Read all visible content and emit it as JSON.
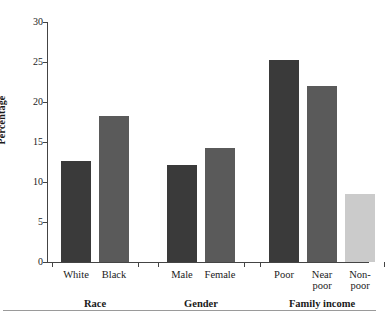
{
  "chart_data": {
    "type": "bar",
    "title": "",
    "xlabel": "",
    "ylabel": "Percentage",
    "ylim": [
      0,
      30
    ],
    "yticks": [
      0,
      5,
      10,
      15,
      20,
      25,
      30
    ],
    "grid": false,
    "legend": null,
    "groups": [
      {
        "name": "Race",
        "categories": [
          "White",
          "Black"
        ],
        "values": [
          12.6,
          18.2
        ],
        "colors": [
          "#3a3a3a",
          "#5a5a5a"
        ]
      },
      {
        "name": "Gender",
        "categories": [
          "Male",
          "Female"
        ],
        "values": [
          12.1,
          14.3
        ],
        "colors": [
          "#3a3a3a",
          "#5a5a5a"
        ]
      },
      {
        "name": "Family income",
        "categories": [
          "Poor",
          "Near poor",
          "Non-poor"
        ],
        "values": [
          25.3,
          22.0,
          8.5
        ],
        "colors": [
          "#3a3a3a",
          "#5a5a5a",
          "#cbcbcb"
        ]
      }
    ],
    "categories": [
      "White",
      "Black",
      "Male",
      "Female",
      "Poor",
      "Near poor",
      "Non-poor"
    ],
    "values": [
      12.6,
      18.2,
      12.1,
      14.3,
      25.3,
      22.0,
      8.5
    ]
  },
  "axis": {
    "y_title": "Percentage",
    "y_tick_labels": [
      "0",
      "5",
      "10",
      "15",
      "20",
      "25",
      "30"
    ]
  },
  "category_labels": [
    {
      "line1": "White",
      "line2": ""
    },
    {
      "line1": "Black",
      "line2": ""
    },
    {
      "line1": "Male",
      "line2": ""
    },
    {
      "line1": "Female",
      "line2": ""
    },
    {
      "line1": "Poor",
      "line2": ""
    },
    {
      "line1": "Near",
      "line2": "poor"
    },
    {
      "line1": "Non-",
      "line2": "poor"
    }
  ],
  "group_labels": [
    "Race",
    "Gender",
    "Family income"
  ]
}
